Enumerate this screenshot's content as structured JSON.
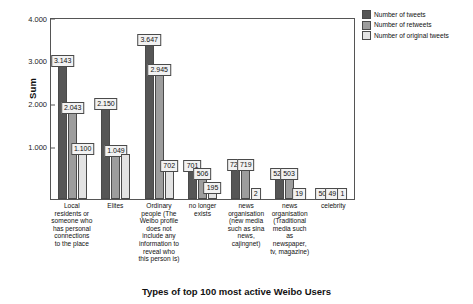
{
  "chart_data": {
    "type": "bar",
    "title": "",
    "xlabel": "Types of top 100 most active Weibo Users",
    "ylabel": "Sum",
    "ylim": [
      0,
      4200
    ],
    "yticks": [
      1000,
      2000,
      3000,
      4000
    ],
    "ytick_labels": [
      "1.000",
      "2.000",
      "3.000",
      "4.000"
    ],
    "grid": false,
    "legend_position": "top-right",
    "categories": [
      "Local residents or someone who has personal connections to the place",
      "Elites",
      "Ordinary people (The Weibo profile does not include any information to reveal who this person is)",
      "no longer exists",
      "news organisation (new media such as sina news, cajingnet)",
      "news organisation (Traditional media such as newspaper, tv, magazine)",
      "celebrity"
    ],
    "series": [
      {
        "name": "Number of tweets",
        "color": "#565656",
        "values": [
          3143,
          2150,
          3647,
          701,
          721,
          522,
          50
        ],
        "labels": [
          "3.143",
          "2.150",
          "3.647",
          "701",
          "721",
          "522",
          "50"
        ]
      },
      {
        "name": "Number of retweets",
        "color": "#9d9d9d",
        "values": [
          2043,
          1049,
          2945,
          506,
          719,
          503,
          49
        ],
        "labels": [
          "2.043",
          "1.049",
          "2.945",
          "506",
          "719",
          "503",
          "49"
        ]
      },
      {
        "name": "Number of original tweets",
        "color": "#e3e3e3",
        "values": [
          1100,
          1049,
          702,
          195,
          2,
          19,
          1
        ],
        "labels": [
          "1.100",
          "",
          "702",
          "195",
          "2",
          "19",
          "1"
        ]
      }
    ]
  },
  "legend": {
    "items": [
      {
        "label": "Number of tweets",
        "color": "#565656"
      },
      {
        "label": "Number of retweets",
        "color": "#9d9d9d"
      },
      {
        "label": "Number of original tweets",
        "color": "#e3e3e3"
      }
    ]
  }
}
